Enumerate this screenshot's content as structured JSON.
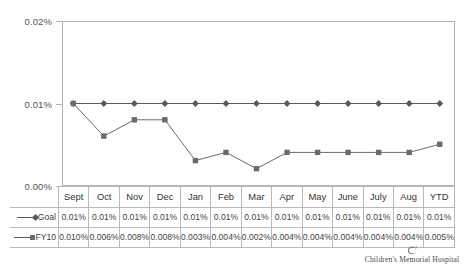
{
  "chart_data": {
    "type": "line",
    "title": "",
    "subtitle": "",
    "xlabel": "",
    "ylabel": "",
    "ylim": [
      0,
      0.02
    ],
    "ytick_labels": [
      "0.02%",
      "0.01%",
      "0.00%"
    ],
    "ytick_values": [
      0.02,
      0.01,
      0.0
    ],
    "grid": false,
    "legend_position": "data-table-left",
    "categories": [
      "Sept",
      "Oct",
      "Nov",
      "Dec",
      "Jan",
      "Feb",
      "Mar",
      "Apr",
      "May",
      "June",
      "July",
      "Aug",
      "YTD"
    ],
    "series": [
      {
        "name": "Goal",
        "marker": "diamond",
        "color": "#595959",
        "values": [
          0.01,
          0.01,
          0.01,
          0.01,
          0.01,
          0.01,
          0.01,
          0.01,
          0.01,
          0.01,
          0.01,
          0.01,
          0.01
        ],
        "labels": [
          "0.01%",
          "0.01%",
          "0.01%",
          "0.01%",
          "0.01%",
          "0.01%",
          "0.01%",
          "0.01%",
          "0.01%",
          "0.01%",
          "0.01%",
          "0.01%",
          "0.01%"
        ]
      },
      {
        "name": "FY10",
        "marker": "square",
        "color": "#6b6b6b",
        "values": [
          0.01,
          0.006,
          0.008,
          0.008,
          0.003,
          0.004,
          0.002,
          0.004,
          0.004,
          0.004,
          0.004,
          0.004,
          0.005
        ],
        "labels": [
          "0.010%",
          "0.006%",
          "0.008%",
          "0.008%",
          "0.003%",
          "0.004%",
          "0.002%",
          "0.004%",
          "0.004%",
          "0.004%",
          "0.004%",
          "0.004%",
          "0.005%"
        ]
      }
    ]
  },
  "data_table": {
    "corner_label": "",
    "headers": [
      "Sept",
      "Oct",
      "Nov",
      "Dec",
      "Jan",
      "Feb",
      "Mar",
      "Apr",
      "May",
      "June",
      "July",
      "Aug",
      "YTD"
    ],
    "rows": [
      {
        "key": "Goal",
        "marker": "diamond",
        "values": [
          "0.01%",
          "0.01%",
          "0.01%",
          "0.01%",
          "0.01%",
          "0.01%",
          "0.01%",
          "0.01%",
          "0.01%",
          "0.01%",
          "0.01%",
          "0.01%",
          "0.01%"
        ]
      },
      {
        "key": "FY10",
        "marker": "square",
        "values": [
          "0.010%",
          "0.006%",
          "0.008%",
          "0.008%",
          "0.003%",
          "0.004%",
          "0.002%",
          "0.004%",
          "0.004%",
          "0.004%",
          "0.004%",
          "0.004%",
          "0.005%"
        ]
      }
    ]
  },
  "logo": {
    "mark": "swirl-icon",
    "text": "Children's Memorial Hospital"
  },
  "colors": {
    "goal_series": "#595959",
    "fy10_series": "#6b6b6b",
    "frame": "#b3b3b3",
    "table_border": "#b8b8b8",
    "text": "#3f3f3f"
  }
}
